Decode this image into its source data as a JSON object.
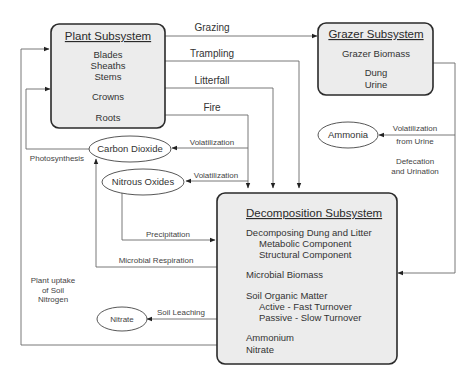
{
  "diagram": {
    "plant": {
      "title": "Plant Subsystem",
      "items": [
        "Blades",
        "Sheaths",
        "Stems",
        "Crowns",
        "Roots"
      ]
    },
    "grazer": {
      "title": "Grazer Subsystem",
      "items": [
        "Grazer Biomass",
        "Dung",
        "Urine"
      ]
    },
    "decomposition": {
      "title": "Decomposition Subsystem",
      "items": [
        "Decomposing Dung and Litter",
        "Metabolic Component",
        "Structural Component",
        "Microbial Biomass",
        "Soil Organic Matter",
        "Active - Fast Turnover",
        "Passive - Slow Turnover",
        "Ammonium",
        "Nitrate"
      ]
    },
    "pools": {
      "carbon_dioxide": "Carbon Dioxide",
      "nitrous_oxides": "Nitrous Oxides",
      "ammonia": "Ammonia",
      "nitrate": "Nitrate"
    },
    "flows": {
      "grazing": "Grazing",
      "trampling": "Trampling",
      "litterfall": "Litterfall",
      "fire": "Fire",
      "volatilization_co2": "Volatilization",
      "volatilization_n2o": "Volatilization",
      "volatilization_urine_1": "Volatilization",
      "volatilization_urine_2": "from Urine",
      "defecation_1": "Defecation",
      "defecation_2": "and Urination",
      "photosynthesis": "Photosynthesis",
      "precipitation": "Precipitation",
      "microbial_respiration": "Microbial Respiration",
      "plant_uptake_1": "Plant uptake",
      "plant_uptake_2": "of Soil",
      "plant_uptake_3": "Nitrogen",
      "soil_leaching": "Soil Leaching"
    }
  }
}
